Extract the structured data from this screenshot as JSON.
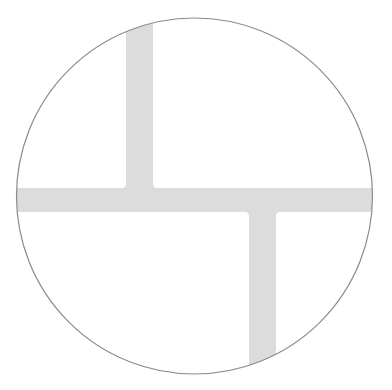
{
  "diagram": {
    "title": "Circular cross-section with offset junction channels",
    "canvas": {
      "width": 392,
      "height": 390,
      "background": "#ffffff"
    },
    "circle": {
      "cx": 194.5,
      "cy": 196,
      "r": 178,
      "stroke": "#8a8a8a",
      "stroke_width": 1.2,
      "fill": "#ffffff"
    },
    "band_color": "#dcdcdc",
    "bands": [
      {
        "name": "horizontal-band",
        "x": 0,
        "y": 188,
        "width": 392,
        "height": 24
      },
      {
        "name": "upper-vertical-band",
        "x": 126,
        "y": 0,
        "width": 27,
        "height": 200
      },
      {
        "name": "lower-vertical-band",
        "x": 249,
        "y": 200,
        "width": 27,
        "height": 190
      }
    ],
    "fillet_radius": 4
  }
}
